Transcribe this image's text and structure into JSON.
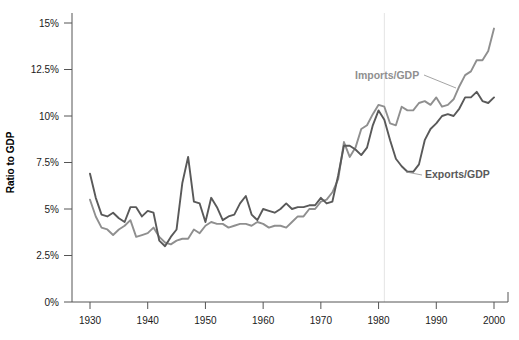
{
  "chart_data": {
    "type": "line",
    "title": "",
    "xlabel": "",
    "ylabel": "Ratio to GDP",
    "xlim": [
      1929,
      2001
    ],
    "ylim": [
      0,
      15
    ],
    "xticks": [
      1930,
      1940,
      1950,
      1960,
      1970,
      1980,
      1990,
      2000
    ],
    "xtick_labels": [
      "1930",
      "1940",
      "1950",
      "1960",
      "1970",
      "1980",
      "1990",
      "2000"
    ],
    "yticks": [
      0,
      2.5,
      5,
      7.5,
      10,
      12.5,
      15
    ],
    "ytick_labels": [
      "0%",
      "2.5%",
      "5%",
      "7.5%",
      "10%",
      "12.5%",
      "15%"
    ],
    "grid": "vertical-single",
    "gridline_x": 1981,
    "legend_position": "inline-annotations",
    "x": [
      1930,
      1931,
      1932,
      1933,
      1934,
      1935,
      1936,
      1937,
      1938,
      1939,
      1940,
      1941,
      1942,
      1943,
      1944,
      1945,
      1946,
      1947,
      1948,
      1949,
      1950,
      1951,
      1952,
      1953,
      1954,
      1955,
      1956,
      1957,
      1958,
      1959,
      1960,
      1961,
      1962,
      1963,
      1964,
      1965,
      1966,
      1967,
      1968,
      1969,
      1970,
      1971,
      1972,
      1973,
      1974,
      1975,
      1976,
      1977,
      1978,
      1979,
      1980,
      1981,
      1982,
      1983,
      1984,
      1985,
      1986,
      1987,
      1988,
      1989,
      1990,
      1991,
      1992,
      1993,
      1994,
      1995,
      1996,
      1997,
      1998,
      1999,
      2000
    ],
    "series": [
      {
        "name": "Exports/GDP",
        "color": "#595959",
        "values": [
          6.9,
          5.6,
          4.7,
          4.6,
          4.8,
          4.5,
          4.3,
          5.1,
          5.1,
          4.6,
          4.9,
          4.8,
          3.3,
          3.0,
          3.5,
          3.9,
          6.4,
          7.8,
          5.4,
          5.3,
          4.3,
          5.6,
          5.1,
          4.4,
          4.6,
          4.7,
          5.3,
          5.7,
          4.7,
          4.4,
          5.0,
          4.9,
          4.8,
          5.0,
          5.3,
          5.0,
          5.1,
          5.1,
          5.2,
          5.2,
          5.6,
          5.3,
          5.4,
          6.8,
          8.4,
          8.4,
          8.2,
          7.9,
          8.3,
          9.5,
          10.3,
          9.8,
          8.7,
          7.7,
          7.3,
          7.0,
          7.0,
          7.4,
          8.7,
          9.3,
          9.6,
          10.0,
          10.1,
          10.0,
          10.4,
          11.0,
          11.0,
          11.3,
          10.8,
          10.7,
          11.0
        ]
      },
      {
        "name": "Imports/GDP",
        "color": "#8f8f8f",
        "values": [
          5.5,
          4.6,
          4.0,
          3.9,
          3.6,
          3.9,
          4.1,
          4.4,
          3.5,
          3.6,
          3.7,
          4.0,
          3.5,
          3.2,
          3.1,
          3.3,
          3.4,
          3.4,
          3.9,
          3.7,
          4.1,
          4.3,
          4.2,
          4.2,
          4.0,
          4.1,
          4.2,
          4.2,
          4.1,
          4.3,
          4.2,
          4.0,
          4.1,
          4.1,
          4.0,
          4.3,
          4.6,
          4.6,
          5.0,
          5.0,
          5.4,
          5.5,
          5.9,
          6.6,
          8.6,
          7.8,
          8.3,
          9.3,
          9.5,
          10.1,
          10.6,
          10.5,
          9.6,
          9.5,
          10.5,
          10.3,
          10.3,
          10.7,
          10.8,
          10.6,
          11.0,
          10.5,
          10.6,
          10.9,
          11.6,
          12.2,
          12.4,
          13.0,
          13.0,
          13.5,
          14.7
        ]
      }
    ],
    "annotations": [
      {
        "label": "Imports/GDP",
        "color": "#8f8f8f"
      },
      {
        "label": "Exports/GDP",
        "color": "#595959"
      }
    ]
  }
}
